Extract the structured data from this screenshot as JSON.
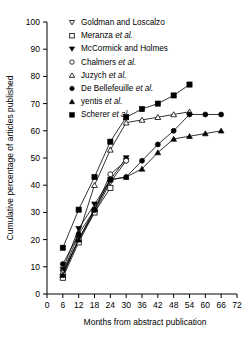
{
  "chart_data": {
    "type": "line",
    "title": "",
    "xlabel": "Months from abstract publication",
    "ylabel": "Cumulative percentage of articles published",
    "xlim": [
      0,
      72
    ],
    "ylim": [
      0,
      100
    ],
    "xticks": [
      0,
      6,
      12,
      18,
      24,
      30,
      36,
      42,
      48,
      54,
      60,
      66,
      72
    ],
    "yticks": [
      0,
      10,
      20,
      30,
      40,
      50,
      60,
      70,
      80,
      90,
      100
    ],
    "grid": false,
    "legend_position": "top-right-inside",
    "series": [
      {
        "name": "Goldman and Loscalzo",
        "marker": "open-down-triangle",
        "x": [
          6,
          12,
          18,
          24,
          30
        ],
        "y": [
          8,
          20,
          30,
          41,
          49
        ]
      },
      {
        "name": "Meranza et al.",
        "marker": "open-square",
        "x": [
          6,
          12,
          18,
          24
        ],
        "y": [
          6,
          19,
          30,
          39
        ]
      },
      {
        "name": "McCormick and Holmes",
        "marker": "filled-down-triangle",
        "x": [
          6,
          12,
          18,
          24,
          30
        ],
        "y": [
          9,
          24,
          33,
          42,
          50
        ]
      },
      {
        "name": "Chalmers et al.",
        "marker": "open-circle",
        "x": [
          6,
          12,
          18,
          24,
          30
        ],
        "y": [
          7,
          20,
          31,
          44,
          49
        ]
      },
      {
        "name": "Juzych et al.",
        "marker": "open-up-triangle",
        "x": [
          6,
          12,
          18,
          24,
          30,
          36,
          42,
          48,
          54
        ],
        "y": [
          8,
          22,
          40,
          53,
          63,
          64,
          65,
          66,
          67
        ]
      },
      {
        "name": "De Bellefeuille et al.",
        "marker": "filled-circle",
        "x": [
          6,
          12,
          18,
          24,
          30,
          36,
          42,
          48,
          54,
          60,
          66
        ],
        "y": [
          11,
          22,
          31,
          42,
          43,
          49,
          55,
          60,
          66,
          66,
          66
        ]
      },
      {
        "name": "yentis et al.",
        "marker": "filled-up-triangle",
        "x": [
          6,
          12,
          18,
          24,
          30,
          36,
          42,
          48,
          54,
          60,
          66
        ],
        "y": [
          7,
          20,
          31,
          42,
          43,
          46,
          52,
          57,
          58,
          59,
          60
        ]
      },
      {
        "name": "Scherer et al.",
        "marker": "filled-square",
        "x": [
          6,
          12,
          18,
          24,
          30,
          36,
          42,
          48,
          54
        ],
        "y": [
          17,
          31,
          43,
          56,
          65,
          68,
          70,
          73,
          77
        ]
      }
    ]
  },
  "legend": {
    "entries": [
      {
        "label_plain": "Goldman and Loscalzo",
        "label_pre": "Goldman and Loscalzo",
        "label_italic": "",
        "marker": "open-down-triangle"
      },
      {
        "label_plain": "Meranza et al.",
        "label_pre": "Meranza ",
        "label_italic": "et al.",
        "marker": "open-square"
      },
      {
        "label_plain": "McCormick and Holmes",
        "label_pre": "McCormick and Holmes",
        "label_italic": "",
        "marker": "filled-down-triangle"
      },
      {
        "label_plain": "Chalmers et al.",
        "label_pre": "Chalmers ",
        "label_italic": "et al.",
        "marker": "open-circle"
      },
      {
        "label_plain": "Juzych et al.",
        "label_pre": "Juzych ",
        "label_italic": "et al.",
        "marker": "open-up-triangle"
      },
      {
        "label_plain": "De Bellefeuille et al.",
        "label_pre": "De Bellefeuille ",
        "label_italic": "et al.",
        "marker": "filled-circle"
      },
      {
        "label_plain": "yentis et al.",
        "label_pre": "yentis ",
        "label_italic": "et al.",
        "marker": "filled-up-triangle"
      },
      {
        "label_plain": "Scherer et al.",
        "label_pre": "Scherer ",
        "label_italic": "et al.",
        "marker": "filled-square"
      }
    ]
  },
  "colors": {
    "ink": "#000000",
    "background": "#ffffff"
  }
}
